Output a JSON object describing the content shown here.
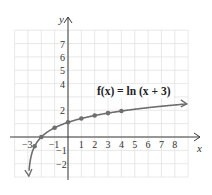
{
  "chart_data": {
    "type": "line",
    "title": "",
    "function_label": "f(x) = ln (x + 3)",
    "xlabel": "x",
    "ylabel": "y",
    "xlim": [
      -4,
      9
    ],
    "ylim": [
      -3,
      8
    ],
    "grid": true,
    "x_ticks": [
      -3,
      -1,
      1,
      2,
      3,
      4,
      5,
      6,
      7,
      8
    ],
    "y_ticks": [
      -2,
      -1,
      2,
      4,
      5,
      6,
      7
    ],
    "x_tick_labels": [
      "−3",
      "−1",
      "1",
      "2",
      "3",
      "4",
      "5",
      "6",
      "7",
      "8"
    ],
    "y_tick_labels": [
      "−2",
      "−1",
      "2",
      "4",
      "5",
      "6",
      "7"
    ],
    "series": [
      {
        "name": "f(x) = ln (x + 3)",
        "color": "#6e6e6e",
        "points": [
          {
            "x": -2.5,
            "y": -0.69
          },
          {
            "x": -2,
            "y": 0
          },
          {
            "x": -1,
            "y": 0.69
          },
          {
            "x": 0,
            "y": 1.1
          },
          {
            "x": 1,
            "y": 1.39
          },
          {
            "x": 2,
            "y": 1.61
          },
          {
            "x": 3,
            "y": 1.79
          },
          {
            "x": 4,
            "y": 1.95
          }
        ],
        "asymptote_x": -3,
        "arrow_ends": [
          "down-left near x=-3",
          "right toward x=9"
        ]
      }
    ]
  },
  "labels": {
    "x_axis": "x",
    "y_axis": "y",
    "function": "f(x) = ln (x + 3)"
  }
}
